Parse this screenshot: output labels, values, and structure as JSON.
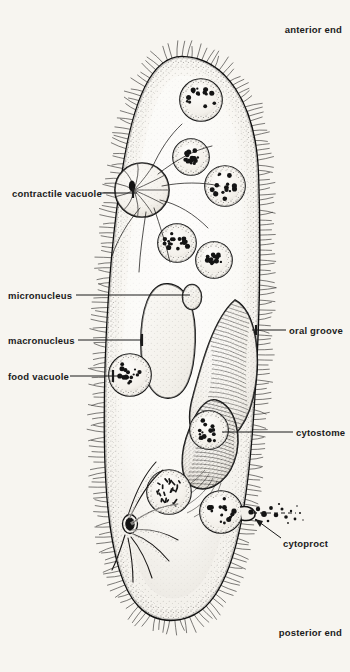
{
  "figure": {
    "organism": "Paramecium",
    "view": "longitudinal section diagram",
    "background_color": "#f7f5f0",
    "ink_color": "#151515"
  },
  "labels": {
    "anterior_end": "anterior end",
    "posterior_end": "posterior end",
    "contractile_vacuole": "contractile vacuole",
    "micronucleus": "micronucleus",
    "macronucleus": "macronucleus",
    "food_vacuole": "food vacuole",
    "oral_groove": "oral groove",
    "cytostome": "cytostome",
    "cytoproct": "cytoproct"
  },
  "structures": {
    "cell_body": {
      "name": "pellicle outline",
      "cilia": "dense cilia fringe around entire body"
    },
    "contractile_vacuoles": [
      {
        "name": "anterior contractile vacuole",
        "cx": 142,
        "cy": 190,
        "r": 27,
        "radial_canals": 11
      },
      {
        "name": "posterior contractile vacuole",
        "cx": 130,
        "cy": 524,
        "r": 26,
        "radial_canals": 8
      }
    ],
    "macronucleus": {
      "cx": 168,
      "cy": 340,
      "rx": 27,
      "ry": 56
    },
    "micronucleus": {
      "cx": 192,
      "cy": 296,
      "rx": 9,
      "ry": 12
    },
    "food_vacuoles": [
      {
        "cx": 201,
        "cy": 100,
        "r": 21
      },
      {
        "cx": 191,
        "cy": 157,
        "r": 18
      },
      {
        "cx": 225,
        "cy": 186,
        "r": 20
      },
      {
        "cx": 177,
        "cy": 243,
        "r": 19
      },
      {
        "cx": 214,
        "cy": 260,
        "r": 18
      },
      {
        "cx": 130,
        "cy": 375,
        "r": 21
      },
      {
        "cx": 209,
        "cy": 430,
        "r": 19
      },
      {
        "cx": 169,
        "cy": 492,
        "r": 22
      },
      {
        "cx": 221,
        "cy": 512,
        "r": 21
      }
    ],
    "oral_groove": {
      "description": "ciliated funnel depression on right flank"
    },
    "cytostome": {
      "description": "mouth opening at base of oral groove"
    },
    "cytoproct": {
      "cx": 244,
      "cy": 513,
      "description": "anal pore ejecting waste particles"
    }
  }
}
